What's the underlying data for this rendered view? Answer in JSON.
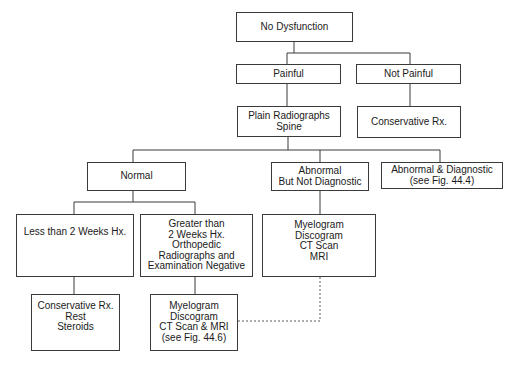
{
  "nodes": {
    "no_dysfunction": [
      "No Dysfunction"
    ],
    "painful": [
      "Painful"
    ],
    "not_painful": [
      "Not Painful"
    ],
    "plain_radiographs": [
      "Plain Radiographs",
      "Spine"
    ],
    "conservative_top": [
      "Conservative Rx."
    ],
    "normal": [
      "Normal"
    ],
    "abnormal_not_diag": [
      "Abnormal",
      "But Not Diagnostic"
    ],
    "abnormal_diag": [
      "Abnormal & Diagnostic",
      "(see Fig. 44.4)"
    ],
    "less_than_2w": [
      "Less than 2 Weeks Hx."
    ],
    "greater_than_2w": [
      "Greater than",
      "2 Weeks Hx.",
      "Orthopedic",
      "Radiographs and",
      "Examination Negative"
    ],
    "myelogram_right": [
      "Myelogram",
      "Discogram",
      "CT Scan",
      "MRI"
    ],
    "conservative_bottom": [
      "Conservative Rx.",
      "Rest",
      "Steroids"
    ],
    "myelogram_bottom": [
      "Myelogram",
      "Discogram",
      "CT Scan & MRI",
      "(see Fig. 44.6)"
    ]
  }
}
